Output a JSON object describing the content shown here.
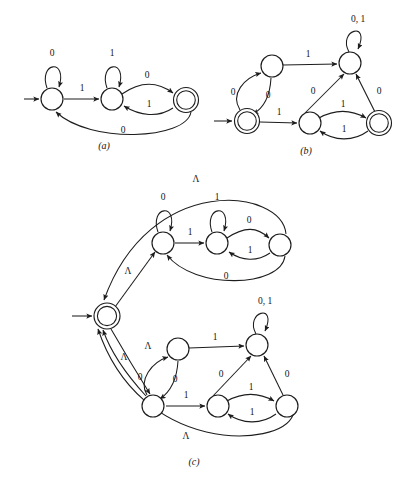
{
  "figure": {
    "background_color": "#ffffff",
    "stroke_color": "#1d1d1d",
    "symbols": {
      "zero": "0",
      "one": "1",
      "zero_one": "0, 1",
      "lambda": "Λ"
    },
    "captions": {
      "a": "(a)",
      "b": "(b)",
      "c": "(c)"
    }
  },
  "diagrams": [
    {
      "id": "a",
      "caption": "(a)",
      "start_state": "q0",
      "accepting_states": [
        "q2"
      ],
      "states": [
        {
          "id": "q0",
          "x": 52,
          "y": 99,
          "accepting": false,
          "start": true
        },
        {
          "id": "q1",
          "x": 112,
          "y": 99,
          "accepting": false,
          "start": false
        },
        {
          "id": "q2",
          "x": 186,
          "y": 100,
          "accepting": true,
          "start": false
        }
      ],
      "transitions": [
        {
          "from": "q0",
          "to": "q0",
          "label": "0",
          "kind": "self-loop"
        },
        {
          "from": "q0",
          "to": "q1",
          "label": "1",
          "kind": "straight"
        },
        {
          "from": "q1",
          "to": "q1",
          "label": "1",
          "kind": "self-loop"
        },
        {
          "from": "q1",
          "to": "q2",
          "label": "0",
          "kind": "curve-top"
        },
        {
          "from": "q2",
          "to": "q1",
          "label": "1",
          "kind": "curve-bottom"
        },
        {
          "from": "q2",
          "to": "q0",
          "label": "0",
          "kind": "long-arc-below"
        }
      ]
    },
    {
      "id": "b",
      "caption": "(b)",
      "start_state": "p0",
      "accepting_states": [
        "p0",
        "p4"
      ],
      "states": [
        {
          "id": "p0",
          "x": 247,
          "y": 121,
          "accepting": true,
          "start": true
        },
        {
          "id": "p1",
          "x": 272,
          "y": 66,
          "accepting": false,
          "start": false
        },
        {
          "id": "p2",
          "x": 350,
          "y": 63,
          "accepting": false,
          "start": false
        },
        {
          "id": "p3",
          "x": 310,
          "y": 123,
          "accepting": false,
          "start": false
        },
        {
          "id": "p4",
          "x": 379,
          "y": 123,
          "accepting": true,
          "start": false
        }
      ],
      "transitions": [
        {
          "from": "p0",
          "to": "p1",
          "label": "0",
          "kind": "curve-left"
        },
        {
          "from": "p1",
          "to": "p0",
          "label": "0",
          "kind": "curve-right"
        },
        {
          "from": "p1",
          "to": "p2",
          "label": "1",
          "kind": "straight"
        },
        {
          "from": "p0",
          "to": "p3",
          "label": "1",
          "kind": "straight"
        },
        {
          "from": "p3",
          "to": "p2",
          "label": "0",
          "kind": "straight"
        },
        {
          "from": "p4",
          "to": "p2",
          "label": "0",
          "kind": "straight"
        },
        {
          "from": "p3",
          "to": "p4",
          "label": "1",
          "kind": "curve-top"
        },
        {
          "from": "p4",
          "to": "p3",
          "label": "1",
          "kind": "curve-bottom"
        },
        {
          "from": "p2",
          "to": "p2",
          "label": "0, 1",
          "kind": "self-loop"
        }
      ]
    },
    {
      "id": "c",
      "caption": "(c)",
      "start_state": "s",
      "accepting_states": [
        "s"
      ],
      "description": "Union/star construction joining machine (a) and machine (b) through lambda transitions from a new start state.",
      "states": [
        {
          "id": "s",
          "x": 107,
          "y": 316,
          "accepting": true,
          "start": true
        },
        {
          "id": "a0",
          "x": 163,
          "y": 243,
          "accepting": false,
          "start": false
        },
        {
          "id": "a1",
          "x": 217,
          "y": 243,
          "accepting": false,
          "start": false
        },
        {
          "id": "a2",
          "x": 280,
          "y": 245,
          "accepting": false,
          "start": false
        },
        {
          "id": "b0",
          "x": 153,
          "y": 406,
          "accepting": false,
          "start": false
        },
        {
          "id": "b1",
          "x": 178,
          "y": 349,
          "accepting": false,
          "start": false
        },
        {
          "id": "b2",
          "x": 257,
          "y": 345,
          "accepting": false,
          "start": false
        },
        {
          "id": "b3",
          "x": 218,
          "y": 406,
          "accepting": false,
          "start": false
        },
        {
          "id": "b4",
          "x": 287,
          "y": 406,
          "accepting": false,
          "start": false
        }
      ],
      "transitions": [
        {
          "from": "s",
          "to": "a0",
          "label": "Λ",
          "kind": "straight"
        },
        {
          "from": "a0",
          "to": "a0",
          "label": "0",
          "kind": "self-loop"
        },
        {
          "from": "a0",
          "to": "a1",
          "label": "1",
          "kind": "straight"
        },
        {
          "from": "a1",
          "to": "a1",
          "label": "1",
          "kind": "self-loop"
        },
        {
          "from": "a1",
          "to": "a2",
          "label": "0",
          "kind": "curve-top"
        },
        {
          "from": "a2",
          "to": "a1",
          "label": "1",
          "kind": "curve-bottom"
        },
        {
          "from": "a2",
          "to": "a0",
          "label": "0",
          "kind": "long-arc-below"
        },
        {
          "from": "a2",
          "to": "s",
          "label": "Λ",
          "kind": "long-arc-top"
        },
        {
          "from": "s",
          "to": "b0",
          "label": "Λ",
          "kind": "straight"
        },
        {
          "from": "b0",
          "to": "b1",
          "label": "0",
          "kind": "curve-left"
        },
        {
          "from": "b1",
          "to": "b0",
          "label": "0",
          "kind": "curve-right"
        },
        {
          "from": "b1",
          "to": "b2",
          "label": "1",
          "kind": "straight"
        },
        {
          "from": "b0",
          "to": "b3",
          "label": "1",
          "kind": "straight"
        },
        {
          "from": "b3",
          "to": "b2",
          "label": "0",
          "kind": "straight"
        },
        {
          "from": "b4",
          "to": "b2",
          "label": "0",
          "kind": "straight"
        },
        {
          "from": "b3",
          "to": "b4",
          "label": "1",
          "kind": "curve-top"
        },
        {
          "from": "b4",
          "to": "b3",
          "label": "1",
          "kind": "curve-bottom"
        },
        {
          "from": "b2",
          "to": "b2",
          "label": "0, 1",
          "kind": "self-loop"
        },
        {
          "from": "b0",
          "to": "s",
          "label": "Λ",
          "kind": "long-arc-left"
        },
        {
          "from": "b4",
          "to": "s",
          "label": "Λ",
          "kind": "long-arc-bottom"
        }
      ]
    }
  ],
  "edge_labels": {
    "a": [
      "0",
      "1",
      "1",
      "0",
      "1",
      "0"
    ],
    "b": [
      "0",
      "0",
      "1",
      "1",
      "0",
      "0",
      "1",
      "1",
      "0, 1"
    ],
    "c": [
      "Λ",
      "0",
      "1",
      "1",
      "0",
      "1",
      "0",
      "Λ",
      "Λ",
      "0",
      "0",
      "1",
      "1",
      "0",
      "0",
      "1",
      "1",
      "0, 1",
      "Λ",
      "Λ"
    ]
  }
}
